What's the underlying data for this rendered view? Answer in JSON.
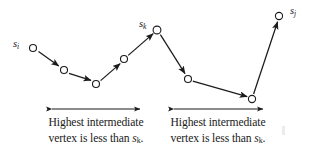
{
  "figure": {
    "background_color": "#ffffff",
    "stroke_color": "#1b1b1b",
    "node_fill_color": "#ffffff"
  },
  "nodes": [
    {
      "name": "s-i",
      "label": "s",
      "sub": "i",
      "x": 33,
      "y": 48,
      "has_label": true,
      "label_x": 13,
      "label_y": 38
    },
    {
      "name": "v2",
      "label": "",
      "sub": "",
      "x": 64,
      "y": 70,
      "has_label": false
    },
    {
      "name": "v3",
      "label": "",
      "sub": "",
      "x": 96,
      "y": 84,
      "has_label": false
    },
    {
      "name": "v4",
      "label": "",
      "sub": "",
      "x": 124,
      "y": 59,
      "has_label": false
    },
    {
      "name": "s-k",
      "label": "s",
      "sub": "k",
      "x": 157,
      "y": 30,
      "has_label": true,
      "label_x": 139,
      "label_y": 18
    },
    {
      "name": "v6",
      "label": "",
      "sub": "",
      "x": 188,
      "y": 79,
      "has_label": false
    },
    {
      "name": "v7",
      "label": "",
      "sub": "",
      "x": 252,
      "y": 99,
      "has_label": false
    },
    {
      "name": "s-j",
      "label": "s",
      "sub": "j",
      "x": 279,
      "y": 16,
      "has_label": true,
      "label_x": 290,
      "label_y": 5
    }
  ],
  "edges": [
    {
      "from": "s-i",
      "to": "v2",
      "arrow": "end"
    },
    {
      "from": "v2",
      "to": "v3",
      "arrow": "end"
    },
    {
      "from": "v3",
      "to": "v4",
      "arrow": "end"
    },
    {
      "from": "v4",
      "to": "s-k",
      "arrow": "end"
    },
    {
      "from": "s-k",
      "to": "v6",
      "arrow": "end"
    },
    {
      "from": "v6",
      "to": "v7",
      "arrow": "end"
    },
    {
      "from": "v7",
      "to": "s-j",
      "arrow": "end"
    }
  ],
  "span_arrows": [
    {
      "name": "span-arrow-left",
      "x1": 50,
      "x2": 142,
      "y": 109
    },
    {
      "name": "span-arrow-right",
      "x1": 172,
      "x2": 265,
      "y": 109
    }
  ],
  "captions": {
    "left": {
      "line1": "Highest intermediate",
      "line2_prefix": "vertex is less than ",
      "line2_symbol": "s",
      "line2_subscript": "k",
      "line2_suffix": "."
    },
    "right": {
      "line1": "Highest intermediate",
      "line2_prefix": "vertex is less than ",
      "line2_symbol": "s",
      "line2_subscript": "k",
      "line2_suffix": "."
    }
  }
}
